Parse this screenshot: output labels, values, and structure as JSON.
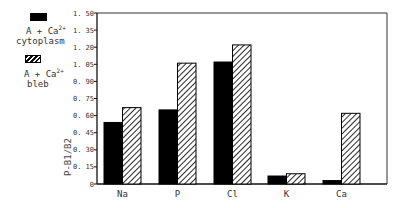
{
  "chart_data": {
    "type": "bar",
    "title": "",
    "xlabel": "",
    "ylabel": "P-B1/B2",
    "ylim": [
      0,
      1.5
    ],
    "yticks": [
      "0",
      "0.15",
      "0.30",
      "0.45",
      "0.60",
      "0.75",
      "0.90",
      "1.05",
      "1.20",
      "1.35",
      "1.50"
    ],
    "categories": [
      "Na",
      "P",
      "Cl",
      "K",
      "Ca"
    ],
    "series": [
      {
        "name": "A + Ca2+ cytoplasm",
        "fill": "solid",
        "color": "#000000",
        "values": [
          0.54,
          0.65,
          1.07,
          0.07,
          0.03
        ]
      },
      {
        "name": "A + Ca2+ bleb",
        "fill": "hatched",
        "color": "#000000",
        "values": [
          0.67,
          1.06,
          1.22,
          0.09,
          0.62
        ]
      }
    ],
    "legend_position": "upper-left-outside",
    "grid": false
  },
  "legend": {
    "items": [
      {
        "line1": "A + Ca",
        "sup": "2+",
        "line2": "cytoplasm"
      },
      {
        "line1": "A + Ca",
        "sup": "2+",
        "line2": "bleb"
      }
    ]
  }
}
